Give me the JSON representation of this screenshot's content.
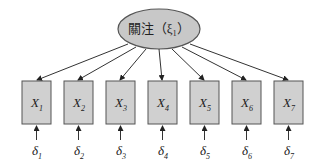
{
  "latent": {
    "label": "關注（ξ₁）",
    "fill": "#c8c8c8"
  },
  "indicators": [
    {
      "name": "X",
      "sub": "1",
      "error": "δ",
      "error_sub": "1"
    },
    {
      "name": "X",
      "sub": "2",
      "error": "δ",
      "error_sub": "2"
    },
    {
      "name": "X",
      "sub": "3",
      "error": "δ",
      "error_sub": "3"
    },
    {
      "name": "X",
      "sub": "4",
      "error": "δ",
      "error_sub": "4"
    },
    {
      "name": "X",
      "sub": "5",
      "error": "δ",
      "error_sub": "5"
    },
    {
      "name": "X",
      "sub": "6",
      "error": "δ",
      "error_sub": "6"
    },
    {
      "name": "X",
      "sub": "7",
      "error": "δ",
      "error_sub": "7"
    }
  ],
  "box_fill": "#d0d0d0"
}
